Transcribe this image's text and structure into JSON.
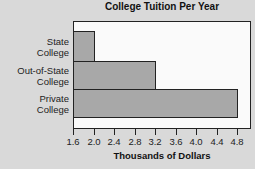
{
  "chart_data": {
    "type": "bar",
    "orientation": "horizontal",
    "title": "College Tuition Per Year",
    "xlabel": "Thousands of Dollars",
    "ylabel": "",
    "categories": [
      "State College",
      "Out-of-State College",
      "Private College"
    ],
    "category_lines": [
      [
        "State",
        "College"
      ],
      [
        "Out-of-State",
        "College"
      ],
      [
        "Private",
        "College"
      ]
    ],
    "values": [
      2.0,
      3.2,
      4.8
    ],
    "xlim": [
      1.6,
      5.0
    ],
    "xticks": [
      "1.6",
      "2.0",
      "2.4",
      "2.8",
      "3.2",
      "3.6",
      "4.0",
      "4.4",
      "4.8"
    ],
    "grid": false,
    "legend": null,
    "colors": {
      "bar": "#a8a8a8",
      "border": "#222222",
      "plot_bg": "#fafafa",
      "page_bg": "#d9d9d9"
    }
  }
}
